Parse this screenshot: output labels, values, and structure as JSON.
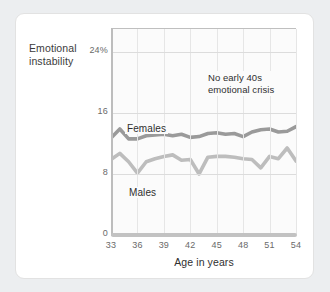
{
  "chart_data": {
    "type": "line",
    "title": "",
    "ylabel_lines": [
      "Emotional",
      "instability"
    ],
    "xlabel": "Age in years",
    "xticks": [
      33,
      36,
      39,
      42,
      45,
      48,
      51,
      54
    ],
    "xtick_labels": [
      "33",
      "36",
      "39",
      "42",
      "45",
      "48",
      "51",
      "54"
    ],
    "yticks": [
      0,
      8,
      16,
      24
    ],
    "ytick_labels": [
      "0",
      "8",
      "16",
      "24%"
    ],
    "xlim": [
      33,
      54
    ],
    "ylim": [
      0,
      27
    ],
    "grid": "both-faint",
    "legend_position": "inline-labels",
    "annotations": [
      {
        "name": "no-crisis-note",
        "lines": [
          "No early 40s",
          "emotional crisis"
        ],
        "x": 45,
        "y": 21
      }
    ],
    "x": [
      33,
      34,
      35,
      36,
      37,
      38,
      39,
      40,
      41,
      42,
      43,
      44,
      45,
      46,
      47,
      48,
      49,
      50,
      51,
      52,
      53,
      54
    ],
    "series": [
      {
        "name": "Females",
        "color": "#9a9a9a",
        "values": [
          12.7,
          13.9,
          12.6,
          12.6,
          13.0,
          13.1,
          13.2,
          13.0,
          13.2,
          12.8,
          12.9,
          13.3,
          13.4,
          13.2,
          13.3,
          12.9,
          13.5,
          13.8,
          13.9,
          13.5,
          13.6,
          14.2
        ]
      },
      {
        "name": "Males",
        "color": "#bdbdbd",
        "values": [
          9.9,
          10.7,
          9.6,
          8.1,
          9.6,
          10.0,
          10.3,
          10.5,
          9.8,
          9.9,
          8.0,
          10.2,
          10.3,
          10.3,
          10.2,
          10.0,
          9.9,
          8.8,
          10.3,
          10.0,
          11.4,
          9.7
        ]
      }
    ]
  },
  "colors": {
    "page_background": "#eceef0",
    "card_background": "#ffffff",
    "card_border": "#e2e2e2",
    "plot_background": "#fbfbfb",
    "axis": "#bdbdbd",
    "gridline": "#e3e3e3",
    "tick_text": "#6a6a6a",
    "label_text": "#2f2f2f",
    "females_line": "#9a9a9a",
    "males_line": "#bdbdbd"
  }
}
